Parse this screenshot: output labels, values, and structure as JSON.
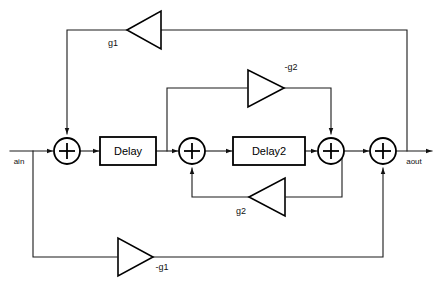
{
  "diagram": {
    "type": "signal-flow-diagram",
    "colors": {
      "line": "#1a1a1a",
      "background": "#ffffff",
      "text": "#111111"
    },
    "io": {
      "input_label": "ain",
      "output_label": "aout"
    },
    "blocks": [
      {
        "id": "delay1",
        "label": "Delay",
        "x": 100,
        "y": 137,
        "w": 56,
        "h": 28
      },
      {
        "id": "delay2",
        "label": "Delay2",
        "x": 233,
        "y": 137,
        "w": 72,
        "h": 28
      }
    ],
    "adders": [
      {
        "id": "sum1",
        "label": "+",
        "cx": 67,
        "cy": 151,
        "r": 13
      },
      {
        "id": "sum2",
        "label": "+",
        "cx": 192,
        "cy": 151,
        "r": 13
      },
      {
        "id": "sum3",
        "label": "+",
        "cx": 331,
        "cy": 151,
        "r": 13
      },
      {
        "id": "sum4",
        "label": "+",
        "cx": 383,
        "cy": 151,
        "r": 13
      }
    ],
    "gains": [
      {
        "id": "gain-g1-top",
        "label": "g1",
        "direction": "left",
        "cx": 144,
        "cy": 30
      },
      {
        "id": "gain-neg-g2",
        "label": "-g2",
        "direction": "right",
        "cx": 265,
        "cy": 88
      },
      {
        "id": "gain-g2",
        "label": "g2",
        "direction": "left",
        "cx": 267,
        "cy": 197
      },
      {
        "id": "gain-neg-g1",
        "label": "-g1",
        "direction": "right",
        "cx": 135,
        "cy": 257
      }
    ]
  }
}
